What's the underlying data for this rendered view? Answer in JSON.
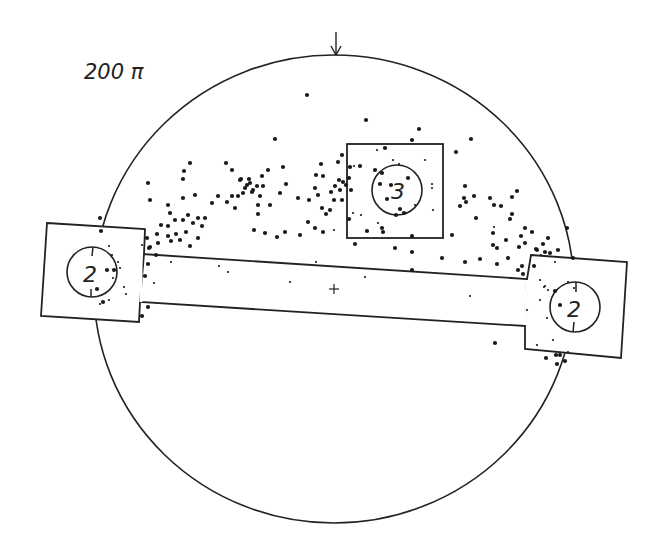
{
  "diagram": {
    "title": "200 π",
    "colors": {
      "ink": "#222222",
      "background": "#ffffff"
    },
    "field": {
      "cx": 334,
      "cy": 289,
      "rx": 240,
      "ry": 234
    },
    "orientation_arrow": {
      "x": 336,
      "y1": 32,
      "y2": 55,
      "icon": "down-arrow-icon"
    },
    "center_mark": {
      "x": 334,
      "y": 289,
      "icon": "crosshair-icon"
    },
    "regions": [
      {
        "id": "left-box",
        "label": "2",
        "circle": {
          "cx": 92,
          "cy": 272,
          "r": 25
        }
      },
      {
        "id": "top-box",
        "label": "3",
        "circle": {
          "cx": 397,
          "cy": 190,
          "r": 25
        }
      },
      {
        "id": "right-box",
        "label": "2",
        "circle": {
          "cx": 575,
          "cy": 307,
          "r": 25
        }
      }
    ],
    "dots_large": [
      [
        307,
        95
      ],
      [
        366,
        120
      ],
      [
        419,
        129
      ],
      [
        471,
        139
      ],
      [
        275,
        139
      ],
      [
        342,
        155
      ],
      [
        321,
        164
      ],
      [
        226,
        163
      ],
      [
        148,
        183
      ],
      [
        183,
        179
      ],
      [
        184,
        171
      ],
      [
        190,
        163
      ],
      [
        250,
        183
      ],
      [
        253,
        190
      ],
      [
        247,
        185
      ],
      [
        245,
        188
      ],
      [
        257,
        186
      ],
      [
        252,
        192
      ],
      [
        243,
        193
      ],
      [
        249,
        179
      ],
      [
        241,
        179
      ],
      [
        263,
        186
      ],
      [
        262,
        176
      ],
      [
        238,
        196
      ],
      [
        260,
        196
      ],
      [
        270,
        205
      ],
      [
        258,
        205
      ],
      [
        232,
        196
      ],
      [
        227,
        202
      ],
      [
        235,
        208
      ],
      [
        240,
        180
      ],
      [
        232,
        170
      ],
      [
        268,
        170
      ],
      [
        283,
        167
      ],
      [
        286,
        184
      ],
      [
        280,
        193
      ],
      [
        298,
        198
      ],
      [
        309,
        200
      ],
      [
        318,
        195
      ],
      [
        316,
        175
      ],
      [
        315,
        188
      ],
      [
        323,
        176
      ],
      [
        338,
        162
      ],
      [
        339,
        180
      ],
      [
        335,
        186
      ],
      [
        331,
        192
      ],
      [
        334,
        200
      ],
      [
        330,
        210
      ],
      [
        322,
        208
      ],
      [
        326,
        214
      ],
      [
        343,
        182
      ],
      [
        340,
        190
      ],
      [
        342,
        200
      ],
      [
        346,
        185
      ],
      [
        308,
        222
      ],
      [
        315,
        228
      ],
      [
        285,
        232
      ],
      [
        258,
        214
      ],
      [
        218,
        196
      ],
      [
        212,
        203
      ],
      [
        205,
        218
      ],
      [
        198,
        218
      ],
      [
        188,
        215
      ],
      [
        183,
        220
      ],
      [
        175,
        220
      ],
      [
        168,
        226
      ],
      [
        161,
        225
      ],
      [
        157,
        234
      ],
      [
        168,
        236
      ],
      [
        176,
        234
      ],
      [
        186,
        232
      ],
      [
        193,
        223
      ],
      [
        180,
        240
      ],
      [
        171,
        241
      ],
      [
        158,
        243
      ],
      [
        150,
        247
      ],
      [
        190,
        246
      ],
      [
        198,
        238
      ],
      [
        202,
        226
      ],
      [
        147,
        238
      ],
      [
        149,
        248
      ],
      [
        150,
        200
      ],
      [
        168,
        205
      ],
      [
        170,
        213
      ],
      [
        183,
        198
      ],
      [
        195,
        195
      ],
      [
        254,
        230
      ],
      [
        265,
        233
      ],
      [
        277,
        237
      ],
      [
        300,
        235
      ],
      [
        349,
        219
      ],
      [
        350,
        167
      ],
      [
        360,
        166
      ],
      [
        375,
        170
      ],
      [
        349,
        178
      ],
      [
        351,
        190
      ],
      [
        387,
        199
      ],
      [
        385,
        148
      ],
      [
        412,
        140
      ],
      [
        456,
        152
      ],
      [
        465,
        186
      ],
      [
        464,
        198
      ],
      [
        460,
        206
      ],
      [
        474,
        196
      ],
      [
        466,
        202
      ],
      [
        490,
        198
      ],
      [
        494,
        205
      ],
      [
        501,
        206
      ],
      [
        512,
        197
      ],
      [
        517,
        191
      ],
      [
        512,
        214
      ],
      [
        510,
        219
      ],
      [
        525,
        228
      ],
      [
        506,
        240
      ],
      [
        476,
        218
      ],
      [
        493,
        233
      ],
      [
        521,
        236
      ],
      [
        519,
        247
      ],
      [
        532,
        232
      ],
      [
        493,
        245
      ],
      [
        497,
        248
      ],
      [
        508,
        258
      ],
      [
        537,
        250
      ],
      [
        545,
        252
      ],
      [
        550,
        253
      ],
      [
        558,
        250
      ],
      [
        567,
        228
      ],
      [
        465,
        262
      ],
      [
        497,
        264
      ],
      [
        518,
        270
      ],
      [
        522,
        266
      ],
      [
        534,
        266
      ],
      [
        555,
        291
      ],
      [
        560,
        305
      ],
      [
        523,
        274
      ],
      [
        536,
        249
      ],
      [
        480,
        259
      ],
      [
        442,
        258
      ],
      [
        355,
        244
      ],
      [
        323,
        232
      ],
      [
        367,
        231
      ],
      [
        382,
        228
      ],
      [
        383,
        232
      ],
      [
        395,
        248
      ],
      [
        412,
        236
      ],
      [
        412,
        270
      ],
      [
        412,
        252
      ],
      [
        452,
        235
      ],
      [
        400,
        209
      ],
      [
        396,
        215
      ],
      [
        404,
        213
      ],
      [
        380,
        184
      ],
      [
        391,
        185
      ],
      [
        408,
        178
      ],
      [
        382,
        173
      ],
      [
        101,
        231
      ],
      [
        100,
        218
      ],
      [
        145,
        276
      ],
      [
        148,
        307
      ],
      [
        142,
        316
      ],
      [
        103,
        302
      ],
      [
        107,
        270
      ],
      [
        97,
        289
      ],
      [
        114,
        270
      ],
      [
        495,
        343
      ],
      [
        573,
        258
      ],
      [
        546,
        358
      ],
      [
        560,
        355
      ],
      [
        556,
        355
      ],
      [
        565,
        361
      ],
      [
        557,
        364
      ],
      [
        543,
        244
      ],
      [
        548,
        238
      ],
      [
        525,
        243
      ],
      [
        148,
        264
      ],
      [
        156,
        255
      ]
    ],
    "dots_small": [
      [
        219,
        266
      ],
      [
        228,
        272
      ],
      [
        112,
        255
      ],
      [
        118,
        262
      ],
      [
        113,
        278
      ],
      [
        124,
        287
      ],
      [
        120,
        268
      ],
      [
        126,
        294
      ],
      [
        109,
        300
      ],
      [
        100,
        304
      ],
      [
        109,
        246
      ],
      [
        142,
        245
      ],
      [
        171,
        262
      ],
      [
        154,
        283
      ],
      [
        290,
        282
      ],
      [
        316,
        262
      ],
      [
        365,
        277
      ],
      [
        334,
        230
      ],
      [
        377,
        150
      ],
      [
        393,
        160
      ],
      [
        399,
        164
      ],
      [
        425,
        160
      ],
      [
        432,
        188
      ],
      [
        433,
        210
      ],
      [
        353,
        213
      ],
      [
        361,
        215
      ],
      [
        378,
        223
      ],
      [
        354,
        166
      ],
      [
        415,
        205
      ],
      [
        432,
        184
      ],
      [
        494,
        227
      ],
      [
        541,
        255
      ],
      [
        555,
        262
      ],
      [
        540,
        280
      ],
      [
        545,
        286
      ],
      [
        548,
        290
      ],
      [
        547,
        318
      ],
      [
        537,
        345
      ],
      [
        553,
        340
      ],
      [
        568,
        352
      ],
      [
        470,
        296
      ],
      [
        544,
        287
      ],
      [
        568,
        282
      ],
      [
        540,
        300
      ],
      [
        527,
        310
      ],
      [
        574,
        288
      ]
    ]
  }
}
